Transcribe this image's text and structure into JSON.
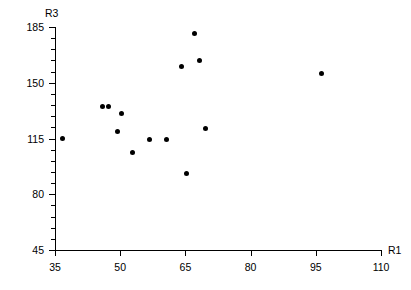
{
  "chart_data": {
    "type": "scatter",
    "title": "",
    "xlabel": "R1",
    "ylabel": "R3",
    "xlim": [
      35,
      110
    ],
    "ylim": [
      45,
      185
    ],
    "grid": false,
    "legend": null,
    "x_ticks": [
      35,
      50,
      65,
      80,
      95,
      110
    ],
    "y_ticks": [
      45,
      80,
      115,
      150,
      185
    ],
    "y_minor_tick_count_per_interval": 4,
    "x_tick_labels": [
      "35",
      "50",
      "65",
      "80",
      "95",
      "110"
    ],
    "y_tick_labels": [
      "45",
      "80",
      "115",
      "150",
      "185"
    ],
    "marker": "filled-circle",
    "marker_color": "#000000",
    "points": [
      {
        "x": 36.7,
        "y": 115.0
      },
      {
        "x": 46.0,
        "y": 135.0
      },
      {
        "x": 47.4,
        "y": 135.0
      },
      {
        "x": 49.3,
        "y": 119.5
      },
      {
        "x": 50.3,
        "y": 131.0
      },
      {
        "x": 52.9,
        "y": 106.0
      },
      {
        "x": 56.8,
        "y": 114.5
      },
      {
        "x": 60.6,
        "y": 114.5
      },
      {
        "x": 64.0,
        "y": 160.0
      },
      {
        "x": 65.2,
        "y": 93.0
      },
      {
        "x": 67.0,
        "y": 181.0
      },
      {
        "x": 68.3,
        "y": 164.0
      },
      {
        "x": 69.7,
        "y": 121.0
      },
      {
        "x": 96.3,
        "y": 156.0
      }
    ],
    "series_name": "R3 vs R1"
  },
  "figure": {
    "background": "#ffffff",
    "axis_color": "#000000",
    "text_color": "#000000"
  }
}
